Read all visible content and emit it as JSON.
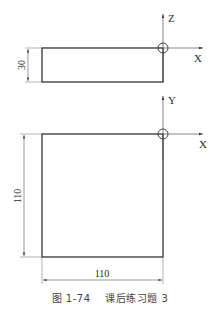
{
  "drawing": {
    "top_view": {
      "axis_vertical_label": "Z",
      "axis_horizontal_label": "X",
      "height_dimension": "30"
    },
    "front_view": {
      "axis_vertical_label": "Y",
      "axis_horizontal_label": "X",
      "height_dimension": "110",
      "width_dimension": "110"
    }
  },
  "caption": {
    "figure_number": "图 1-74",
    "title": "课后练习题 3"
  }
}
